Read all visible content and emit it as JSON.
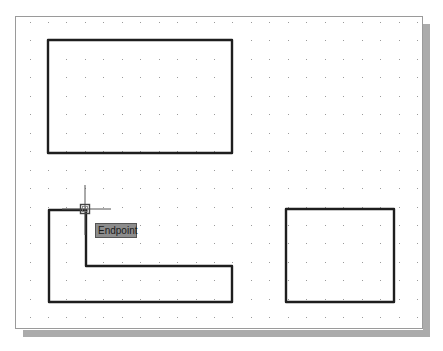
{
  "drawing": {
    "frame": {
      "x": 15,
      "y": 16,
      "width": 408,
      "height": 313,
      "border_color": "#9a9a9a",
      "shadow_color": "#ababab"
    },
    "grid": {
      "origin_x": 29.5,
      "origin_y": 22,
      "spacing": 18.45,
      "cols": 22,
      "rows": 17,
      "dot_color": "#9a9a9a"
    },
    "line_color": "#1e1e1e",
    "shapes": [
      {
        "name": "rectangle-top-left",
        "type": "polygon",
        "points": "48,40 232,40 232,153 48,153"
      },
      {
        "name": "l-shape",
        "type": "polygon",
        "points": "49,210 86,210 86,266 232,266 232,302 49,302"
      },
      {
        "name": "rectangle-bottom-right",
        "type": "polygon",
        "points": "286,209 394,209 394,302 286,302"
      }
    ],
    "cursor": {
      "x": 85,
      "y": 209,
      "v_top": 185,
      "v_bottom": 235,
      "h_left": 62,
      "h_right": 111,
      "snap_box": 9
    }
  },
  "tooltip": {
    "label": "Endpoint",
    "bg": "#8c8c8c"
  }
}
